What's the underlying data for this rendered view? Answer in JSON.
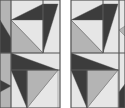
{
  "colors": {
    "background": "#ffffff",
    "light": "#e6e6e6",
    "mid": "#b4b4b4",
    "dark": "#3c3c3c",
    "line": "#555555"
  },
  "panels": [
    {
      "name": "pattern-panel-left",
      "x": 0,
      "y": 0,
      "w": 60,
      "h": 108,
      "polys": [
        {
          "fill": "light",
          "pts": "0,0 60,0 60,108 0,108"
        },
        {
          "fill": "mid",
          "pts": "0,0 11,0 11,53 0,53"
        },
        {
          "fill": "dark",
          "pts": "0,20 11,38 11,53 0,53"
        },
        {
          "fill": "dark",
          "pts": "11,20 43,4 43,53"
        },
        {
          "fill": "dark",
          "pts": "43,4 58,4 43,53"
        },
        {
          "fill": "light",
          "pts": "11,20 43,53 43,20"
        },
        {
          "fill": "mid",
          "pts": "11,20 11,53 43,53"
        },
        {
          "fill": "dark",
          "pts": "11,53 58,70 11,70"
        },
        {
          "fill": "dark",
          "pts": "11,70 27,70 27,108"
        },
        {
          "fill": "light",
          "pts": "27,108 58,70 58,108"
        },
        {
          "fill": "mid",
          "pts": "27,70 58,70 27,108"
        },
        {
          "fill": "mid",
          "pts": "0,53 11,53 11,108 0,108"
        },
        {
          "fill": "dark",
          "pts": "0,80 11,86 0,92"
        }
      ],
      "lines": [
        "11,0 11,108",
        "0,53 60,53",
        "43,0 43,53",
        "11,70 60,70",
        "27,70 27,108",
        "0,0 60,0 60,108 0,108 0,0"
      ]
    },
    {
      "name": "pattern-panel-right",
      "x": 71,
      "y": 0,
      "w": 54,
      "h": 108,
      "polys": [
        {
          "fill": "light",
          "pts": "71,0 125,0 125,108 71,108"
        },
        {
          "fill": "dark",
          "pts": "71,20 103,4 103,53"
        },
        {
          "fill": "dark",
          "pts": "103,4 118,4 103,53"
        },
        {
          "fill": "light",
          "pts": "71,20 103,53 103,20"
        },
        {
          "fill": "mid",
          "pts": "71,20 71,53 103,53"
        },
        {
          "fill": "dark",
          "pts": "71,53 118,70 71,70"
        },
        {
          "fill": "dark",
          "pts": "71,70 87,70 87,108"
        },
        {
          "fill": "light",
          "pts": "87,108 118,70 118,108"
        },
        {
          "fill": "mid",
          "pts": "87,70 118,70 87,108"
        },
        {
          "fill": "light",
          "pts": "119,0 125,0 125,108 119,108"
        },
        {
          "fill": "dark",
          "pts": "119,92 125,84 125,108 119,108"
        },
        {
          "fill": "mid",
          "pts": "119,30 125,26 125,36"
        }
      ],
      "lines": [
        "119,0 119,108",
        "71,53 125,53",
        "103,0 103,53",
        "71,70 119,70",
        "87,70 87,108",
        "71,0 125,0 125,108 71,108 71,0"
      ]
    }
  ]
}
